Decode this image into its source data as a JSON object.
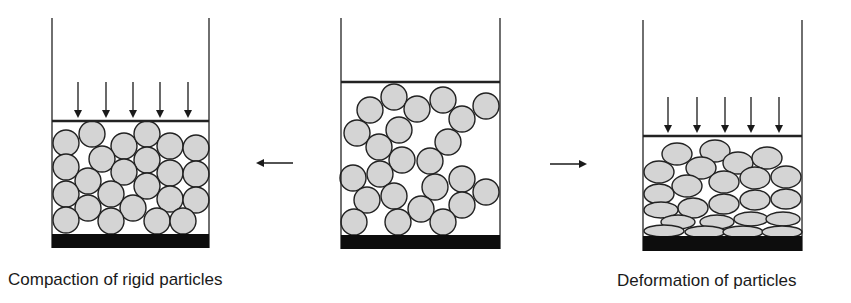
{
  "colors": {
    "background": "#ffffff",
    "outline": "#222222",
    "particle_fill": "#d4d4d4",
    "base": "#0d0d0d"
  },
  "captions": {
    "left": "Compaction of rigid particles",
    "right": "Deformation of particles"
  },
  "panels": [
    {
      "id": "compaction-rigid",
      "wall_left": 52,
      "wall_right": 209,
      "wall_top": 18,
      "plate_y": 121,
      "base_top": 234,
      "base_bottom": 248,
      "press_arrows": [
        78,
        106,
        133,
        160,
        188
      ],
      "arrow_top": 82,
      "arrow_bottom": 116,
      "particle_shape": "circle",
      "particles": [
        [
          66,
          143,
          13,
          13
        ],
        [
          92,
          134,
          13,
          13
        ],
        [
          124,
          146,
          13,
          13
        ],
        [
          147,
          134,
          13,
          13
        ],
        [
          170,
          146,
          13,
          13
        ],
        [
          196,
          148,
          13,
          13
        ],
        [
          102,
          159,
          13,
          13
        ],
        [
          147,
          160,
          13,
          13
        ],
        [
          66,
          167,
          13,
          13
        ],
        [
          124,
          172,
          13,
          13
        ],
        [
          170,
          173,
          13,
          13
        ],
        [
          196,
          174,
          13,
          13
        ],
        [
          88,
          181,
          13,
          13
        ],
        [
          147,
          186,
          13,
          13
        ],
        [
          66,
          194,
          13,
          13
        ],
        [
          111,
          194,
          13,
          13
        ],
        [
          170,
          199,
          13,
          13
        ],
        [
          196,
          200,
          13,
          13
        ],
        [
          88,
          208,
          13,
          13
        ],
        [
          133,
          208,
          13,
          13
        ],
        [
          66,
          220,
          13,
          13
        ],
        [
          111,
          221,
          13,
          13
        ],
        [
          157,
          221,
          13,
          13
        ],
        [
          183,
          221,
          13,
          13
        ]
      ]
    },
    {
      "id": "initial-loose",
      "wall_left": 341,
      "wall_right": 500,
      "wall_top": 18,
      "plate_y": 82,
      "base_top": 235,
      "base_bottom": 249,
      "press_arrows": [],
      "particle_shape": "circle",
      "particles": [
        [
          394,
          97,
          13,
          13
        ],
        [
          370,
          110,
          13,
          13
        ],
        [
          417,
          109,
          13,
          13
        ],
        [
          443,
          100,
          13,
          13
        ],
        [
          486,
          106,
          13,
          13
        ],
        [
          462,
          119,
          13,
          13
        ],
        [
          357,
          133,
          13,
          13
        ],
        [
          399,
          130,
          13,
          13
        ],
        [
          448,
          142,
          13,
          13
        ],
        [
          379,
          147,
          13,
          13
        ],
        [
          402,
          160,
          13,
          13
        ],
        [
          430,
          161,
          13,
          13
        ],
        [
          353,
          178,
          13,
          13
        ],
        [
          380,
          174,
          13,
          13
        ],
        [
          435,
          187,
          13,
          13
        ],
        [
          462,
          179,
          13,
          13
        ],
        [
          486,
          192,
          13,
          13
        ],
        [
          367,
          200,
          13,
          13
        ],
        [
          394,
          196,
          13,
          13
        ],
        [
          421,
          209,
          13,
          13
        ],
        [
          462,
          205,
          13,
          13
        ],
        [
          354,
          222,
          13,
          13
        ],
        [
          398,
          222,
          13,
          13
        ],
        [
          443,
          222,
          13,
          13
        ]
      ]
    },
    {
      "id": "deformation",
      "wall_left": 643,
      "wall_right": 802,
      "wall_top": 20,
      "plate_y": 136,
      "base_top": 236,
      "base_bottom": 251,
      "press_arrows": [
        668,
        697,
        725,
        751,
        779
      ],
      "arrow_top": 97,
      "arrow_bottom": 131,
      "particle_shape": "ellipse",
      "particles": [
        [
          677,
          154,
          15,
          11
        ],
        [
          715,
          151,
          15,
          11
        ],
        [
          738,
          163,
          15,
          11
        ],
        [
          767,
          158,
          15,
          11
        ],
        [
          659,
          172,
          15,
          11
        ],
        [
          701,
          168,
          15,
          11
        ],
        [
          724,
          182,
          15,
          11
        ],
        [
          755,
          178,
          15,
          11
        ],
        [
          786,
          177,
          15,
          11
        ],
        [
          687,
          186,
          15,
          11
        ],
        [
          659,
          194,
          15,
          10
        ],
        [
          693,
          208,
          15,
          10
        ],
        [
          724,
          204,
          15,
          10
        ],
        [
          755,
          200,
          15,
          10
        ],
        [
          786,
          199,
          15,
          10
        ],
        [
          661,
          210,
          17,
          8
        ],
        [
          678,
          222,
          17,
          7
        ],
        [
          717,
          222,
          17,
          7
        ],
        [
          751,
          219,
          17,
          7
        ],
        [
          783,
          219,
          17,
          7
        ],
        [
          664,
          231,
          20,
          6
        ],
        [
          705,
          232,
          20,
          6
        ],
        [
          743,
          232,
          20,
          6
        ],
        [
          782,
          232,
          20,
          6
        ]
      ]
    }
  ],
  "transition_arrows": [
    {
      "id": "to-compaction",
      "x1": 293,
      "x2": 258,
      "y": 163
    },
    {
      "id": "to-deformation",
      "x1": 550,
      "x2": 585,
      "y": 164
    }
  ]
}
